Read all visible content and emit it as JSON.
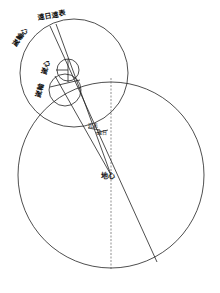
{
  "diagram": {
    "title": "",
    "labels": {
      "outer_top_left": "嵗輪心",
      "outer_top_right": "遠日遠表",
      "small_upper": "嵗心",
      "small_lower_left": "嵗輪",
      "mid_upper": "近表",
      "mid_lower": "遠日",
      "center": "地心"
    },
    "shapes": {
      "large_circle": {
        "cx": 111,
        "cy": 175,
        "r": 93
      },
      "upper_circle": {
        "cx": 74,
        "cy": 73,
        "r": 54
      },
      "small_circle_upper": {
        "cx": 68,
        "cy": 70,
        "r": 11
      },
      "small_circle_lower": {
        "cx": 65,
        "cy": 90,
        "r": 16
      }
    },
    "stroke_color": "#222222"
  }
}
